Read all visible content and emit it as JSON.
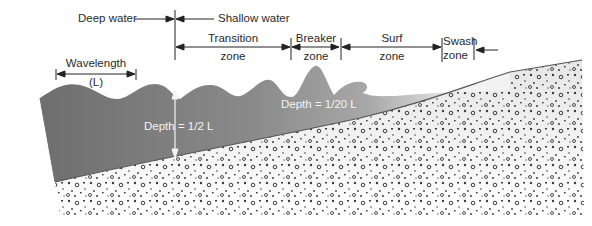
{
  "diagram": {
    "colors": {
      "water_deep": "#6f6f6f",
      "water_shallow": "#b8b8b8",
      "sediment": "#f2f2f2",
      "pebble": "#1a1a1a",
      "line": "#222222",
      "depth_text": "#f4f4f4"
    },
    "boundary_labels": {
      "deep_water": "Deep water",
      "shallow_water": "Shallow water"
    },
    "zones": [
      {
        "line1": "Transition",
        "line2": "zone"
      },
      {
        "line1": "Breaker",
        "line2": "zone"
      },
      {
        "line1": "Surf",
        "line2": "zone"
      },
      {
        "line1": "Swash",
        "line2": "zone"
      }
    ],
    "wavelength": {
      "label": "Wavelength",
      "symbol": "(L)"
    },
    "depth_labels": {
      "deep": "Depth = 1/2 L",
      "shallow": "Depth = 1/20 L"
    }
  }
}
